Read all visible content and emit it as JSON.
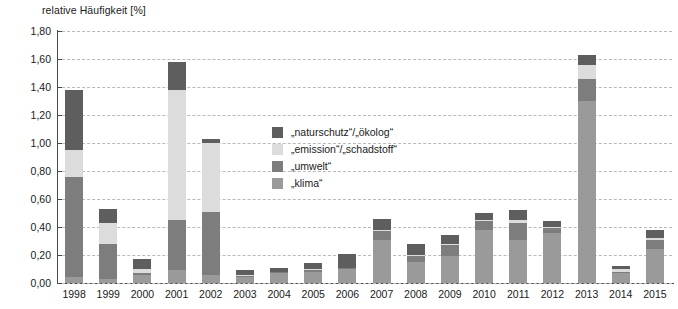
{
  "chart_data": {
    "type": "bar",
    "stacked": true,
    "title": "relative Häufigkeit [%]",
    "xlabel": "",
    "ylabel": "relative Häufigkeit [%]",
    "ylim": [
      0.0,
      1.8
    ],
    "ytick_step": 0.2,
    "grid": true,
    "legend_position": "center",
    "categories": [
      "1998",
      "1999",
      "2000",
      "2001",
      "2002",
      "2003",
      "2004",
      "2005",
      "2006",
      "2007",
      "2008",
      "2009",
      "2010",
      "2011",
      "2012",
      "2013",
      "2014",
      "2015"
    ],
    "ytick_labels": [
      "1,80",
      "1,60",
      "1,40",
      "1,20",
      "1,00",
      "0,80",
      "0,60",
      "0,40",
      "0,20",
      "0,00"
    ],
    "ytick_values": [
      1.8,
      1.6,
      1.4,
      1.2,
      1.0,
      0.8,
      0.6,
      0.4,
      0.2,
      0.0
    ],
    "series": [
      {
        "name": "„klima“",
        "color": "#9a9a9a",
        "values": [
          0.04,
          0.03,
          0.06,
          0.09,
          0.06,
          0.04,
          0.07,
          0.08,
          0.1,
          0.31,
          0.15,
          0.19,
          0.38,
          0.31,
          0.36,
          1.3,
          0.07,
          0.24
        ]
      },
      {
        "name": "„umwelt“",
        "color": "#7d7d7d",
        "values": [
          0.72,
          0.25,
          0.01,
          0.36,
          0.45,
          0.01,
          0.01,
          0.01,
          0.01,
          0.06,
          0.04,
          0.08,
          0.06,
          0.12,
          0.03,
          0.16,
          0.01,
          0.07
        ]
      },
      {
        "name": "„emission“/„schadstoff“",
        "color": "#dcdcdc",
        "values": [
          0.19,
          0.15,
          0.03,
          0.93,
          0.49,
          0.01,
          0.0,
          0.01,
          0.0,
          0.01,
          0.01,
          0.01,
          0.01,
          0.02,
          0.01,
          0.1,
          0.02,
          0.01
        ]
      },
      {
        "name": "„naturschutz“/„ökolog“",
        "color": "#5e5e5e",
        "values": [
          0.43,
          0.1,
          0.07,
          0.2,
          0.03,
          0.03,
          0.03,
          0.04,
          0.1,
          0.08,
          0.08,
          0.06,
          0.05,
          0.07,
          0.04,
          0.07,
          0.02,
          0.06
        ]
      }
    ],
    "totals": [
      1.38,
      0.53,
      0.17,
      1.58,
      1.03,
      0.09,
      0.11,
      0.14,
      0.21,
      0.46,
      0.28,
      0.34,
      0.5,
      0.52,
      0.44,
      1.63,
      0.12,
      0.38
    ],
    "legend_order": [
      "„naturschutz“/„ökolog“",
      "„emission“/„schadstoff“",
      "„umwelt“",
      "„klima“"
    ]
  },
  "colors": {
    "naturschutz": "#5e5e5e",
    "emission": "#dcdcdc",
    "umwelt": "#7d7d7d",
    "klima": "#9a9a9a",
    "axis": "#4a4a4a",
    "grid": "#b9b9b9",
    "text": "#1a1a1a",
    "background": "#ffffff"
  }
}
